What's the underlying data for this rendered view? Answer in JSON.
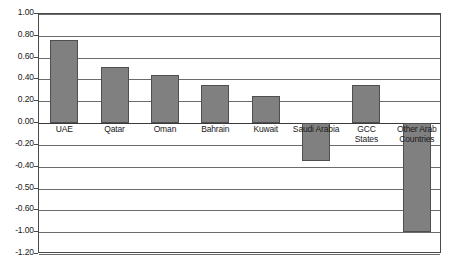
{
  "chart_data": {
    "type": "bar",
    "title": "",
    "subtitle": "",
    "xlabel": "",
    "ylabel": "",
    "grid": true,
    "legend": false,
    "legend_position": "none",
    "categories": [
      "UAE",
      "Qatar",
      "Oman",
      "Bahrain",
      "Kuwait",
      "Saudi Arabia",
      "GCC\nStates",
      "Other Arab\nCountries"
    ],
    "values": [
      0.76,
      0.51,
      0.44,
      0.35,
      0.25,
      -0.35,
      0.35,
      -1.0
    ],
    "ylim": [
      -1.2,
      1.0
    ],
    "y_tick_labels": [
      "1.00",
      "0.80",
      "0.60",
      "0.40",
      "0.20",
      "0.00",
      "-0.20",
      "-0.40",
      "-0.50",
      "-0.60",
      "-1.00",
      "-1.20"
    ],
    "bar_color": "#808080",
    "bar_edge_color": "#4f4f4f",
    "gridline_color": "#6b6b6b",
    "axis_color": "#4a4a4a",
    "zero_tick_index": 5
  }
}
